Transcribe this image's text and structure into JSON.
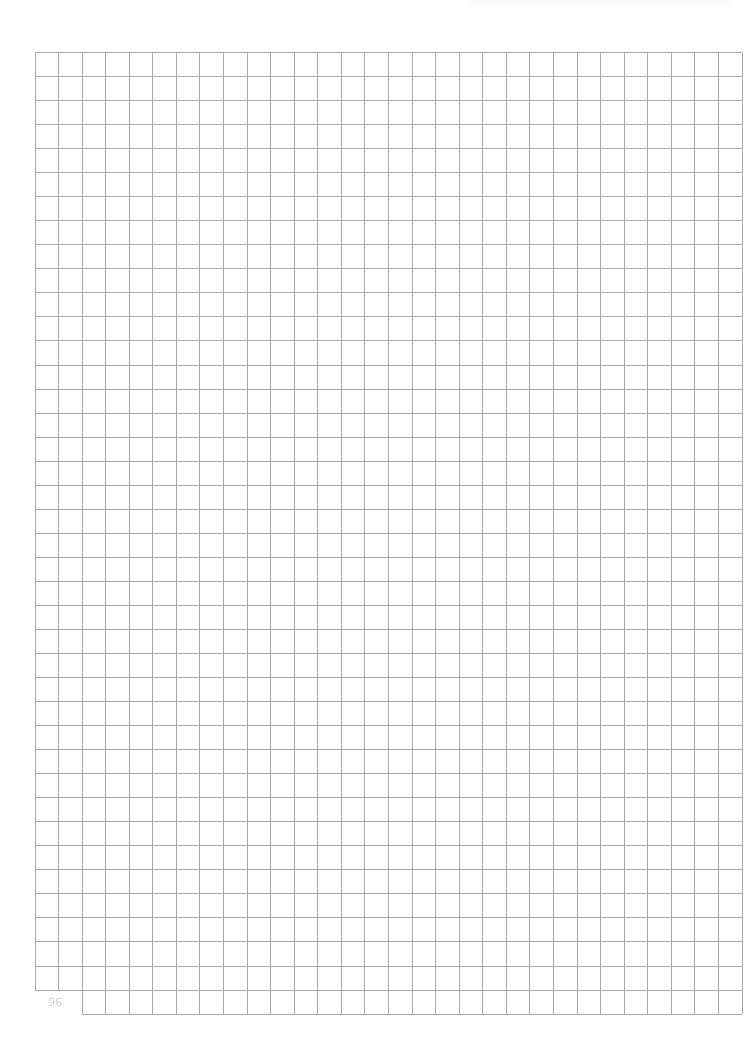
{
  "page": {
    "type": "graph-paper",
    "page_number": "96",
    "background_color": "#ffffff"
  },
  "grid": {
    "columns": 30,
    "rows": 40,
    "origin_x": 35,
    "origin_y": 52.5,
    "cell_width": 23.57,
    "cell_height": 24.04,
    "line_color": "#a9a9a9",
    "line_width": 1,
    "notch": {
      "description": "bottom-left two columns omit the last row to make room for the page number",
      "columns_omitted_in_last_row": 2
    }
  }
}
